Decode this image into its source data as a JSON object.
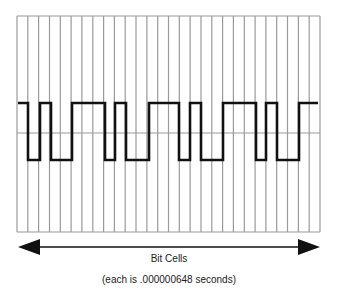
{
  "diagram": {
    "type": "digital-waveform-timing",
    "frame": {
      "left": 17,
      "right": 320,
      "top": 16,
      "bottom": 232
    },
    "grid": {
      "cell_count": 28,
      "cell_width": 10.8,
      "line_color": "#9a9a9a",
      "midline_y": 133
    },
    "waveform": {
      "color": "#111111",
      "high_y": 103,
      "low_y": 160,
      "start_level": "high",
      "transitions_x": [
        28,
        40,
        51,
        72,
        105,
        115,
        126,
        149,
        179,
        190,
        201,
        223,
        256,
        266,
        277,
        299
      ],
      "end_x": 318
    },
    "arrow": {
      "y": 247,
      "x_start": 18,
      "x_end": 320,
      "color": "#111111"
    }
  },
  "labels": {
    "axis_label": "Bit Cells",
    "axis_sublabel": "(each is .000000648 seconds)"
  }
}
